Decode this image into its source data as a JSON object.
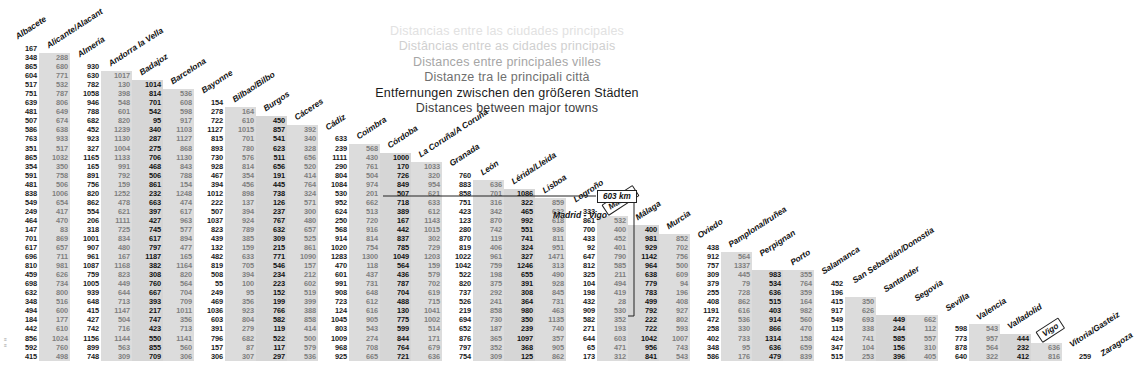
{
  "titles": {
    "lines": [
      "Distancias entre las ciudades principales",
      "Distâncias entre as cidades principais",
      "Distances entre principales villes",
      "Distanze tra le principali città",
      "Entfernungen zwischen den größeren Städten",
      "Distances between major towns"
    ]
  },
  "callout": {
    "distance": "603 km",
    "pair": "Madrid - Vigo",
    "from": "Madrid",
    "to": "Vigo"
  },
  "colors": {
    "shade_band": "#d6d6d6",
    "light_text": "#7f7f7f",
    "dark_text": "#1b1b1b",
    "line": "#222222"
  },
  "chart_data": {
    "type": "table",
    "title": "Distances between major towns",
    "note": "Lower-triangular road-distance matrix in kilometres between 36 Iberian cities.",
    "units": "km",
    "cities": [
      "Albacete",
      "Alicante/Alacant",
      "Almería",
      "Andorra la Vella",
      "Badajoz",
      "Barcelona",
      "Bayonne",
      "Bilbao/Bilbo",
      "Burgos",
      "Cáceres",
      "Cádiz",
      "Coimbra",
      "Córdoba",
      "La Coruña/A Coruña",
      "Granada",
      "León",
      "Lérida/Lleida",
      "Lisboa",
      "Logroño",
      "Madrid",
      "Málaga",
      "Murcia",
      "Oviedo",
      "Pamplona/Iruñea",
      "Perpignan",
      "Porto",
      "Salamanca",
      "San Sebastián/Donostia",
      "Santander",
      "Segovia",
      "Sevilla",
      "Valencia",
      "Valladolid",
      "Vigo",
      "Vitoria/Gasteiz",
      "Zaragoza"
    ],
    "rows": [
      [
        167
      ],
      [
        348,
        288
      ],
      [
        865,
        680,
        930
      ],
      [
        604,
        771,
        630,
        1017
      ],
      [
        517,
        532,
        782,
        130,
        1014
      ],
      [
        751,
        787,
        1058,
        398,
        814,
        536
      ],
      [
        639,
        806,
        946,
        548,
        701,
        608,
        154
      ],
      [
        481,
        649,
        788,
        601,
        542,
        598,
        278,
        164
      ],
      [
        507,
        674,
        682,
        820,
        95,
        917,
        722,
        610,
        450
      ],
      [
        586,
        638,
        452,
        1239,
        340,
        1103,
        1127,
        1015,
        857,
        392
      ],
      [
        763,
        933,
        923,
        1130,
        287,
        1127,
        815,
        701,
        541,
        340,
        633
      ],
      [
        351,
        517,
        327,
        1004,
        275,
        868,
        893,
        780,
        623,
        328,
        239,
        568
      ],
      [
        865,
        1032,
        1165,
        1133,
        706,
        1130,
        730,
        576,
        511,
        656,
        1111,
        430,
        1000
      ],
      [
        354,
        350,
        165,
        991,
        468,
        843,
        928,
        814,
        656,
        520,
        290,
        761,
        170,
        1033
      ],
      [
        591,
        758,
        891,
        792,
        506,
        788,
        467,
        354,
        191,
        414,
        804,
        504,
        726,
        320,
        760
      ],
      [
        481,
        506,
        756,
        159,
        861,
        154,
        394,
        456,
        445,
        764,
        1084,
        974,
        849,
        954,
        883,
        636
      ],
      [
        838,
        1006,
        820,
        1252,
        232,
        1248,
        1012,
        898,
        738,
        324,
        530,
        201,
        507,
        621,
        858,
        701,
        1086
      ],
      [
        549,
        654,
        862,
        478,
        663,
        474,
        222,
        137,
        126,
        571,
        952,
        662,
        718,
        633,
        751,
        316,
        322,
        859
      ],
      [
        249,
        417,
        554,
        621,
        397,
        617,
        507,
        394,
        237,
        300,
        624,
        513,
        389,
        612,
        423,
        342,
        465,
        632,
        333
      ],
      [
        464,
        470,
        206,
        1111,
        427,
        963,
        1037,
        924,
        767,
        480,
        250,
        720,
        167,
        1143,
        123,
        870,
        992,
        618,
        861,
        532
      ],
      [
        147,
        83,
        318,
        725,
        745,
        577,
        823,
        789,
        632,
        657,
        568,
        916,
        442,
        1015,
        280,
        742,
        551,
        936,
        700,
        400,
        400
      ],
      [
        701,
        869,
        1001,
        834,
        617,
        894,
        439,
        385,
        309,
        525,
        914,
        814,
        837,
        302,
        870,
        119,
        741,
        811,
        433,
        452,
        981,
        852
      ],
      [
        617,
        657,
        907,
        480,
        797,
        477,
        132,
        159,
        215,
        861,
        1020,
        754,
        785,
        729,
        819,
        406,
        324,
        951,
        92,
        401,
        929,
        702,
        438
      ],
      [
        696,
        711,
        961,
        167,
        1187,
        165,
        482,
        633,
        771,
        1090,
        1283,
        1300,
        1049,
        1203,
        1022,
        961,
        327,
        1471,
        647,
        790,
        1142,
        756,
        912,
        564
      ],
      [
        810,
        981,
        1087,
        1168,
        382,
        1164,
        819,
        705,
        546,
        157,
        470,
        118,
        564,
        159,
        1042,
        759,
        1246,
        313,
        812,
        585,
        964,
        500,
        757,
        1337
      ],
      [
        459,
        626,
        759,
        823,
        308,
        820,
        508,
        394,
        234,
        212,
        601,
        437,
        436,
        579,
        522,
        198,
        655,
        490,
        325,
        211,
        638,
        609,
        309,
        445,
        983,
        355
      ],
      [
        698,
        734,
        1005,
        449,
        760,
        564,
        55,
        100,
        223,
        602,
        991,
        731,
        787,
        702,
        820,
        375,
        391,
        928,
        104,
        494,
        779,
        94,
        379,
        79,
        534,
        764,
        452
      ],
      [
        632,
        800,
        939,
        644,
        667,
        704,
        249,
        95,
        152,
        519,
        908,
        648,
        704,
        619,
        737,
        292,
        308,
        845,
        198,
        419,
        783,
        196,
        255,
        728,
        636,
        359,
        196
      ],
      [
        348,
        516,
        648,
        713,
        393,
        709,
        469,
        356,
        199,
        399,
        723,
        612,
        488,
        715,
        526,
        241,
        364,
        731,
        432,
        28,
        499,
        408,
        408,
        862,
        515,
        164,
        415,
        350
      ],
      [
        494,
        600,
        415,
        1147,
        217,
        1011,
        1036,
        923,
        766,
        388,
        124,
        616,
        130,
        1041,
        219,
        858,
        980,
        463,
        909,
        530,
        792,
        927,
        1191,
        616,
        403,
        982,
        917,
        626
      ],
      [
        184,
        177,
        427,
        504,
        747,
        356,
        603,
        804,
        582,
        858,
        1045,
        905,
        775,
        1002,
        694,
        730,
        350,
        1135,
        582,
        352,
        222,
        802,
        472,
        536,
        914,
        560,
        549,
        693,
        449,
        662
      ],
      [
        442,
        610,
        742,
        716,
        423,
        713,
        391,
        279,
        119,
        414,
        803,
        543,
        599,
        514,
        652,
        187,
        239,
        740,
        271,
        193,
        722,
        593,
        258,
        330,
        866,
        470,
        115,
        338,
        244,
        112,
        598,
        543
      ],
      [
        856,
        1024,
        1156,
        1144,
        550,
        1141,
        796,
        682,
        522,
        500,
        1009,
        274,
        844,
        171,
        876,
        365,
        1097,
        357,
        644,
        603,
        1042,
        1007,
        402,
        733,
        1314,
        158,
        424,
        741,
        585,
        557,
        773,
        957,
        444
      ],
      [
        592,
        760,
        899,
        563,
        855,
        560,
        157,
        87,
        117,
        579,
        968,
        708,
        764,
        679,
        797,
        352,
        368,
        905,
        65,
        471,
        956,
        743,
        348,
        95,
        636,
        659,
        347,
        104,
        156,
        310,
        878,
        564,
        232,
        636
      ],
      [
        415,
        498,
        748,
        309,
        709,
        306,
        306,
        307,
        297,
        536,
        925,
        665,
        721,
        636,
        754,
        309,
        125,
        862,
        173,
        312,
        841,
        543,
        586,
        176,
        479,
        839,
        515,
        253,
        396,
        405,
        640,
        322,
        412,
        816,
        259
      ]
    ]
  }
}
